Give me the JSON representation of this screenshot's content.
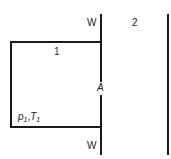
{
  "diagram": {
    "wall_top_label": "W",
    "wall_bottom_label": "W",
    "region_1_label": "1",
    "region_2_label": "2",
    "aperture_label": "A",
    "state_p": "p",
    "state_p_sub": "1",
    "state_sep": ",",
    "state_T": "T",
    "state_T_sub": "1"
  }
}
